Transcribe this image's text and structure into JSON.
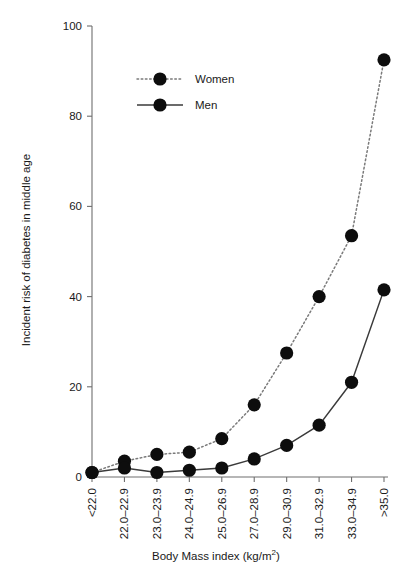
{
  "chart_data": {
    "type": "line",
    "title": "",
    "xlabel": "Body Mass index (kg/m²)",
    "ylabel": "Incident risk of diabetes in middle age",
    "categories": [
      "<22.0",
      "22.0–22.9",
      "23.0–23.9",
      "24.0–24.9",
      "25.0–26.9",
      "27.0–28.9",
      "29.0–30.9",
      "31.0–32.9",
      "33.0–34.9",
      ">35.0"
    ],
    "series": [
      {
        "name": "Women",
        "style": "dotted",
        "values": [
          1,
          3.5,
          5,
          5.5,
          8.5,
          16,
          27.5,
          40,
          53.5,
          92.5
        ]
      },
      {
        "name": "Men",
        "style": "solid",
        "values": [
          1,
          2,
          1,
          1.5,
          2,
          4,
          7,
          11.5,
          21,
          41.5
        ]
      }
    ],
    "ylim": [
      0,
      100
    ],
    "yticks": [
      0,
      20,
      40,
      60,
      80,
      100
    ],
    "ytick_labels": [
      "0",
      "20",
      "40",
      "60",
      "80",
      "100"
    ],
    "grid": false,
    "legend_position": "upper-center"
  },
  "axes": {
    "x_title": "Body Mass index (kg/m²)",
    "x_title_main": "Body Mass index (kg/m",
    "x_title_sup": "2",
    "x_title_tail": ")",
    "y_title": "Incident risk of diabetes in middle age"
  },
  "legend": {
    "items": [
      {
        "label": "Women",
        "style": "dotted"
      },
      {
        "label": "Men",
        "style": "solid"
      }
    ]
  }
}
